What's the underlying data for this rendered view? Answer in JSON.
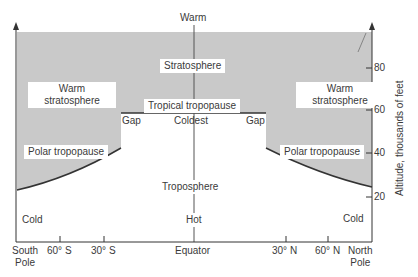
{
  "diagram": {
    "title_top": "Warm",
    "regions": {
      "stratosphere": "Stratosphere",
      "warm_strat_left_1": "Warm",
      "warm_strat_left_2": "stratosphere",
      "warm_strat_right_1": "Warm",
      "warm_strat_right_2": "stratosphere",
      "tropical_tropopause": "Tropical tropopause",
      "gap_left": "Gap",
      "gap_right": "Gap",
      "coldest": "Coldest",
      "polar_left": "Polar tropopause",
      "polar_right": "Polar tropopause",
      "troposphere": "Troposphere",
      "hot": "Hot",
      "cold_left": "Cold",
      "cold_right": "Cold"
    },
    "x_axis": {
      "south_pole_1": "South",
      "south_pole_2": "Pole",
      "s60": "60° S",
      "s30": "30° S",
      "equator": "Equator",
      "n30": "30° N",
      "n60": "60° N",
      "north_pole_1": "North",
      "north_pole_2": "Pole"
    },
    "y_axis": {
      "label": "Altitude, thousands of feet",
      "ticks": [
        "80",
        "60",
        "40",
        "20"
      ]
    },
    "colors": {
      "shade": "#c9c9c9",
      "line": "#333333"
    }
  }
}
